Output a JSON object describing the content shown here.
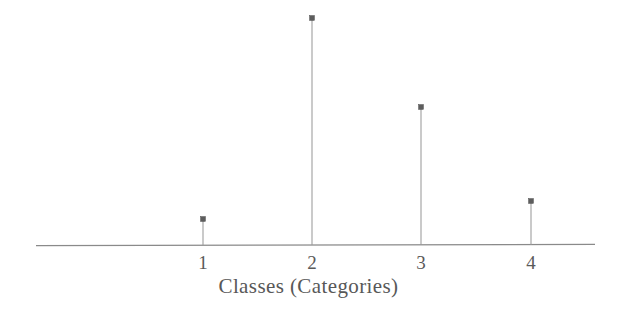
{
  "figure": {
    "background_color": "#ffffff",
    "ink_color": "#5a5a5a",
    "axis_color": "#8a8a8a",
    "stem_color": "#9a9a9a",
    "marker_color": "#5d5d5d",
    "axis_title": "Classes (Categories)"
  },
  "chart_data": {
    "type": "bar",
    "style": "stem-plot",
    "title": "",
    "subtitle": "",
    "xlabel": "Classes (Categories)",
    "ylabel": "",
    "categories": [
      "1",
      "2",
      "3",
      "4"
    ],
    "tick_labels": [
      "1",
      "2",
      "3",
      "4"
    ],
    "values": [
      0.115,
      1.0,
      0.608,
      0.194
    ],
    "pixel_heights": [
      26,
      227,
      138,
      44
    ],
    "xlim": [
      0.35,
      4.55
    ],
    "ylim": [
      0,
      1.05
    ],
    "grid": false,
    "legend": null,
    "legend_position": "none",
    "annotations": [],
    "axis_visible": {
      "x": true,
      "y": false
    },
    "series": [
      {
        "name": "probability mass",
        "values": [
          0.115,
          1.0,
          0.608,
          0.194
        ]
      }
    ]
  },
  "marks": {
    "stems": [
      {
        "label": "1",
        "x_px": 203,
        "top_y_px": 219,
        "baseline_y_px": 245
      },
      {
        "label": "2",
        "x_px": 312,
        "top_y_px": 18,
        "baseline_y_px": 245
      },
      {
        "label": "3",
        "x_px": 421,
        "top_y_px": 107,
        "baseline_y_px": 245
      },
      {
        "label": "4",
        "x_px": 531,
        "top_y_px": 201,
        "baseline_y_px": 245
      }
    ],
    "axis": {
      "x_start_px": 36,
      "x_end_px": 595,
      "y_px": 245
    }
  }
}
